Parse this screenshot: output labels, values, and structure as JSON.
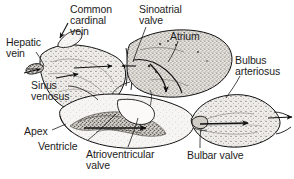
{
  "figure": {
    "background_color": "#ffffff",
    "ink_color": "#1d1d1d",
    "outline_color": "#111111",
    "shading_fill": "#e8e6e2",
    "chamber_fill": "#f7f6f4"
  },
  "labels": {
    "common_cardinal_vein": {
      "lines": [
        "Common",
        "cardinal",
        "vein"
      ],
      "x": 70,
      "y": 4
    },
    "sinoatrial_valve": {
      "lines": [
        "Sinoatrial",
        "valve"
      ],
      "x": 139,
      "y": 4
    },
    "atrium": {
      "lines": [
        "Atrium"
      ],
      "x": 170,
      "y": 31
    },
    "hepatic_vein": {
      "lines": [
        "Hepatic",
        "vein"
      ],
      "x": 6,
      "y": 37
    },
    "bulbus_arteriosus": {
      "lines": [
        "Bulbus",
        "arteriosus"
      ],
      "x": 235,
      "y": 55
    },
    "sinus_venosus": {
      "lines": [
        "Sinus",
        "venosus"
      ],
      "x": 31,
      "y": 80
    },
    "apex": {
      "lines": [
        "Apex"
      ],
      "x": 24,
      "y": 126
    },
    "ventricle": {
      "lines": [
        "Ventricle"
      ],
      "x": 38,
      "y": 141
    },
    "atrioventricular_valve": {
      "lines": [
        "Atrioventricular",
        "valve"
      ],
      "x": 86,
      "y": 149
    },
    "bulbar_valve": {
      "lines": [
        "Bulbar valve"
      ],
      "x": 187,
      "y": 150
    }
  },
  "structures": [
    {
      "name": "sinus-venosus",
      "label": "Sinus venosus"
    },
    {
      "name": "hepatic-vein",
      "label": "Hepatic vein"
    },
    {
      "name": "common-cardinal-vein",
      "label": "Common cardinal vein"
    },
    {
      "name": "sinoatrial-valve",
      "label": "Sinoatrial valve"
    },
    {
      "name": "atrium",
      "label": "Atrium"
    },
    {
      "name": "atrioventricular-valve",
      "label": "Atrioventricular valve"
    },
    {
      "name": "ventricle",
      "label": "Ventricle"
    },
    {
      "name": "apex",
      "label": "Apex"
    },
    {
      "name": "bulbar-valve",
      "label": "Bulbar valve"
    },
    {
      "name": "bulbus-arteriosus",
      "label": "Bulbus arteriosus"
    }
  ],
  "flow_arrows": {
    "count": 7,
    "description": "Blood flow direction arrows through sinus venosus, atrium, ventricle and bulbus arteriosus"
  }
}
